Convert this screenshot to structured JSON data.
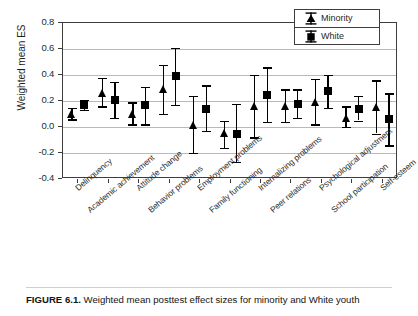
{
  "figure": {
    "caption_label": "FIGURE 6.1.",
    "caption_text": "Weighted mean posttest effect sizes for minority and White youth"
  },
  "legend": {
    "position": "top-right",
    "entries": [
      {
        "label": "Minority",
        "marker": "triangle-marker-icon",
        "color": "#000000"
      },
      {
        "label": "White",
        "marker": "square-marker-icon",
        "color": "#000000"
      }
    ]
  },
  "chart_data": {
    "type": "scatter",
    "title": "",
    "subtitle": "",
    "xlabel": "",
    "ylabel": "Weighted mean ES",
    "ylim": [
      -0.4,
      0.8
    ],
    "yticks": [
      0.8,
      0.6,
      0.4,
      0.2,
      0.0,
      -0.2,
      -0.4
    ],
    "ytick_labels": [
      "0.8",
      "0.6",
      "0.4",
      "0.2",
      "0.0",
      "-0.2",
      "-0.4"
    ],
    "grid": true,
    "grid_axis": "y",
    "error_bars": true,
    "categories": [
      "Delinquency",
      "Academic achievement",
      "Attitude change",
      "Behavior problems",
      "Employment problems",
      "Family functioning",
      "Internalizing problems",
      "Peer relations",
      "Psychological adjustment",
      "School participation",
      "Self-esteem"
    ],
    "series": [
      {
        "name": "Minority",
        "marker": "triangle",
        "values": [
          0.1,
          0.26,
          0.1,
          0.29,
          0.01,
          -0.05,
          0.16,
          0.16,
          0.19,
          0.07,
          0.15
        ],
        "ci_low": [
          0.06,
          0.16,
          0.02,
          0.1,
          -0.2,
          -0.16,
          -0.08,
          0.04,
          0.02,
          0.0,
          -0.05
        ],
        "ci_high": [
          0.15,
          0.38,
          0.19,
          0.48,
          0.24,
          0.05,
          0.4,
          0.29,
          0.37,
          0.16,
          0.36
        ]
      },
      {
        "name": "White",
        "marker": "square",
        "values": [
          0.17,
          0.21,
          0.17,
          0.39,
          0.14,
          -0.05,
          0.25,
          0.18,
          0.28,
          0.14,
          0.06
        ],
        "ci_low": [
          0.13,
          0.07,
          0.02,
          0.17,
          -0.03,
          -0.27,
          0.04,
          0.07,
          0.15,
          0.05,
          -0.14
        ],
        "ci_high": [
          0.21,
          0.35,
          0.31,
          0.61,
          0.32,
          0.18,
          0.46,
          0.29,
          0.4,
          0.24,
          0.26
        ]
      }
    ]
  }
}
